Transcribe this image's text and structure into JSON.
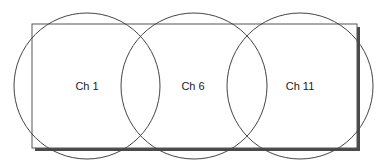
{
  "diagram": {
    "title": "",
    "colors": {
      "background": "#ffffff",
      "outline": "#555555",
      "shadow": "#444444"
    },
    "area": {
      "x": 32,
      "y": 24,
      "width": 325,
      "height": 124,
      "shadow_offset": 3
    },
    "channels": [
      {
        "label": "Ch 1",
        "cx": 87,
        "cy": 86,
        "r": 73
      },
      {
        "label": "Ch 6",
        "cx": 194,
        "cy": 86,
        "r": 73
      },
      {
        "label": "Ch 11",
        "cx": 300,
        "cy": 86,
        "r": 73
      }
    ]
  }
}
